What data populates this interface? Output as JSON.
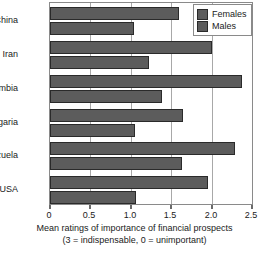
{
  "chart_data": {
    "type": "bar",
    "orientation": "horizontal",
    "title": "",
    "xlabel": "Mean ratings of importance of financial prospects",
    "xlabel_line2": "(3 = indispensable, 0 = unimportant)",
    "ylabel": "",
    "categories": [
      "China",
      "Iran",
      "Zambia",
      "Bulgaria",
      "Venezuela",
      "USA"
    ],
    "series": [
      {
        "name": "Females",
        "values": [
          1.6,
          2.01,
          2.38,
          1.65,
          2.29,
          1.96
        ]
      },
      {
        "name": "Males",
        "values": [
          1.04,
          1.23,
          1.38,
          1.05,
          1.63,
          1.07
        ]
      }
    ],
    "xlim": [
      0,
      2.5
    ],
    "xticks": [
      0,
      0.5,
      1.0,
      1.5,
      2.0,
      2.5
    ],
    "xticklabels": [
      "0",
      "0.5",
      "1.0",
      "1.5",
      "2.0",
      "2.5"
    ],
    "grid": true,
    "grid_axis": "x",
    "legend_position": "top-right",
    "colors": {
      "bar_females": "#5c5c5c",
      "bar_males": "#5c5c5c",
      "bar_edge": "#2a2a2a",
      "gridline": "#a8a8a8",
      "axis": "#8a8a8a",
      "text": "#1a1a1a",
      "background": "#ffffff"
    }
  },
  "legend": {
    "items": [
      {
        "label": "Females"
      },
      {
        "label": "Males"
      }
    ]
  }
}
